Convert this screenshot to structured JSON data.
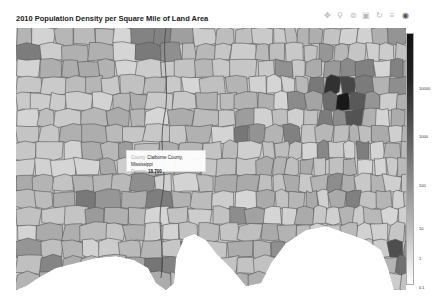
{
  "title": "2010 Population Density per Square Mile of Land Area",
  "toolbar": {
    "buttons": [
      {
        "name": "pan-button",
        "icon": "pan-icon",
        "glyph": "✥"
      },
      {
        "name": "box-zoom-button",
        "icon": "box-zoom-icon",
        "glyph": "⚲"
      },
      {
        "name": "wheel-zoom-button",
        "icon": "wheel-zoom-icon",
        "glyph": "⊜"
      },
      {
        "name": "save-button",
        "icon": "save-icon",
        "glyph": "▣"
      },
      {
        "name": "reset-button",
        "icon": "reset-icon",
        "glyph": "↻"
      },
      {
        "name": "help-button",
        "icon": "help-icon",
        "glyph": "≡"
      },
      {
        "name": "hover-button",
        "icon": "hover-icon",
        "glyph": "◉"
      }
    ]
  },
  "colorbar": {
    "ticks": [
      {
        "label": "10000",
        "top": 88
      },
      {
        "label": "1000",
        "top": 136
      },
      {
        "label": "100",
        "top": 185
      },
      {
        "label": "10",
        "top": 228
      },
      {
        "label": "1",
        "top": 258
      },
      {
        "label": "0.1",
        "top": 287
      }
    ],
    "low_color": "#ffffff",
    "high_color": "#111111"
  },
  "tooltip": {
    "county_key": "County",
    "county_value": "Claiborne County, Mississippi",
    "density_key": "Density",
    "density_value": "18.700"
  },
  "map": {
    "region": "Southeastern United States counties",
    "metric": "Population density per square mile",
    "year": "2010",
    "hotspots": [
      {
        "label": "Atlanta metro",
        "x": 330,
        "y": 65,
        "shade": "#2a2a2a"
      },
      {
        "label": "Memphis area",
        "x": 155,
        "y": 15,
        "shade": "#444"
      },
      {
        "label": "Birmingham area",
        "x": 230,
        "y": 105,
        "shade": "#555"
      },
      {
        "label": "New Orleans area",
        "x": 145,
        "y": 240,
        "shade": "#333"
      },
      {
        "label": "Jacksonville area",
        "x": 385,
        "y": 230,
        "shade": "#444"
      }
    ]
  }
}
